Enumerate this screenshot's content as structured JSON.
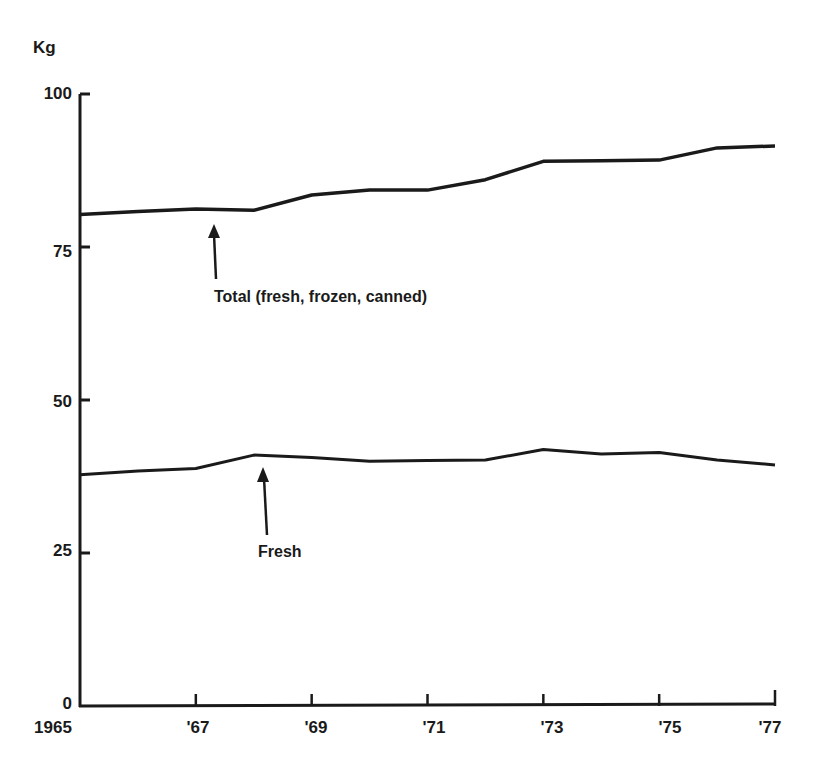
{
  "chart_data": {
    "type": "line",
    "title": "",
    "xlabel": "",
    "ylabel": "Kg",
    "ylim": [
      0,
      100
    ],
    "xlim": [
      1965,
      1977
    ],
    "grid": false,
    "legend_position": "inline annotations with arrows",
    "y_ticks": [
      0,
      25,
      50,
      75,
      100
    ],
    "y_tick_labels": [
      "0",
      "25",
      "50",
      "75",
      "100"
    ],
    "x_ticks": [
      1965,
      1967,
      1969,
      1971,
      1973,
      1975,
      1977
    ],
    "x_tick_labels": [
      "1965",
      "'67",
      "'69",
      "'71",
      "'73",
      "'75",
      "'77"
    ],
    "x": [
      1965,
      1966,
      1967,
      1968,
      1969,
      1970,
      1971,
      1972,
      1973,
      1974,
      1975,
      1976,
      1977
    ],
    "series": [
      {
        "name": "Total (fresh, frozen, canned)",
        "values": [
          80.3,
          80.8,
          81.2,
          81.0,
          83.5,
          84.3,
          84.3,
          86.0,
          89.0,
          89.1,
          89.2,
          91.2,
          91.5
        ]
      },
      {
        "name": "Fresh",
        "values": [
          37.8,
          38.4,
          38.8,
          41.0,
          40.6,
          40.0,
          40.1,
          40.2,
          41.9,
          41.2,
          41.4,
          40.2,
          39.4
        ]
      }
    ],
    "annotations": [
      {
        "text": "Total (fresh, frozen, canned)",
        "points_to": "Total",
        "x": 1967.1
      },
      {
        "text": "Fresh",
        "points_to": "Fresh",
        "x": 1968.0
      }
    ]
  },
  "labels": {
    "y_unit": "Kg",
    "total_annotation": "Total (fresh, frozen, canned)",
    "fresh_annotation": "Fresh",
    "y_ticks": [
      "0",
      "25",
      "50",
      "75",
      "100"
    ],
    "x_ticks": [
      "1965",
      "'67",
      "'69",
      "'71",
      "'73",
      "'75",
      "'77"
    ]
  },
  "style": {
    "line_color": "#1a1a1a",
    "background": "#ffffff"
  }
}
